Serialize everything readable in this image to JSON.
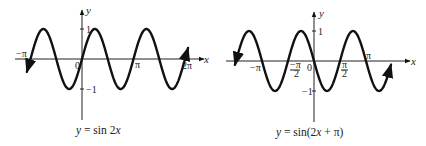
{
  "chart_data": [
    {
      "type": "line",
      "title": "y = sin 2x",
      "caption": "y = sin 2x",
      "xlabel": "x",
      "ylabel": "y",
      "x_ticks": [
        "−π",
        "0",
        "π",
        "2π"
      ],
      "y_ticks": [
        "1",
        "−1"
      ],
      "xlim": [
        "-1.2π",
        "2.1π"
      ],
      "ylim": [
        -1.6,
        1.3
      ],
      "grid": false,
      "legend": "none",
      "function": "sin(2x)",
      "series": [
        {
          "name": "sin 2x",
          "x": [
            "-π",
            "-3π/4",
            "-π/2",
            "-π/4",
            "0",
            "π/4",
            "π/2",
            "3π/4",
            "π",
            "5π/4",
            "3π/2",
            "7π/4",
            "2π"
          ],
          "values": [
            0,
            1,
            0,
            -1,
            0,
            1,
            0,
            -1,
            0,
            1,
            0,
            -1,
            0
          ]
        }
      ]
    },
    {
      "type": "line",
      "title": "y = sin(2x + π)",
      "caption": "y = sin(2x + π)",
      "xlabel": "x",
      "ylabel": "y",
      "x_ticks": [
        "−π",
        "−π/2",
        "0",
        "π/2",
        "π"
      ],
      "y_ticks": [
        "1",
        "−1"
      ],
      "xlim": [
        "-1.5π",
        "1.5π"
      ],
      "ylim": [
        -1.6,
        1.3
      ],
      "grid": false,
      "legend": "none",
      "function": "sin(2x+π)",
      "series": [
        {
          "name": "sin(2x + π)",
          "x": [
            "-3π/2",
            "-5π/4",
            "-π",
            "-3π/4",
            "-π/2",
            "-π/4",
            "0",
            "π/4",
            "π/2",
            "3π/4",
            "π",
            "5π/4"
          ],
          "values": [
            0,
            -1,
            0,
            1,
            0,
            1,
            0,
            -1,
            0,
            1,
            0,
            -1
          ]
        }
      ]
    }
  ],
  "graphs": [
    {
      "caption_parts": {
        "y": "y",
        "eq": " = sin 2",
        "x": "x"
      },
      "labels": {
        "y_axis": "y",
        "x_axis": "x",
        "one": "1",
        "neg_one": "−1",
        "origin": "0",
        "neg_pi": "−π",
        "pi": "π",
        "two_pi": "2π"
      }
    },
    {
      "caption_parts": {
        "y": "y",
        "eq1": " = sin(2",
        "x": "x",
        "eq2": " + π)"
      },
      "labels": {
        "y_axis": "y",
        "x_axis": "x",
        "one": "1",
        "neg_one": "−1",
        "origin": "0",
        "neg_pi": "−π",
        "neg_pi_num": "−π",
        "neg_pi_den": "2",
        "pi_num": "π",
        "pi_den": "2",
        "pi": "π"
      }
    }
  ]
}
